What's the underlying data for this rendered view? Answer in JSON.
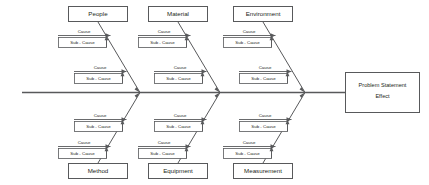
{
  "diagram": {
    "type": "fishbone-ishikawa-cause-and-effect",
    "colors": {
      "line": "#58595b",
      "text": "#231f20",
      "background": "#ffffff"
    },
    "effect": {
      "line1": "Problem Statement",
      "line2": "Effect"
    },
    "cause_label": "Cause",
    "subcause_label": "Sub - Cause",
    "categories": {
      "top": [
        {
          "id": "people",
          "label": "People",
          "causes": [
            {
              "label": "Cause",
              "subcause": "Sub - Cause"
            },
            {
              "label": "Cause",
              "subcause": "Sub - Cause"
            }
          ]
        },
        {
          "id": "material",
          "label": "Material",
          "causes": [
            {
              "label": "Cause",
              "subcause": "Sub - Cause"
            },
            {
              "label": "Cause",
              "subcause": "Sub - Cause"
            }
          ]
        },
        {
          "id": "environment",
          "label": "Environment",
          "causes": [
            {
              "label": "Cause",
              "subcause": "Sub - Cause"
            },
            {
              "label": "Cause",
              "subcause": "Sub - Cause"
            }
          ]
        }
      ],
      "bottom": [
        {
          "id": "method",
          "label": "Method",
          "causes": [
            {
              "label": "Cause",
              "subcause": "Sub - Cause"
            },
            {
              "label": "Cause",
              "subcause": "Sub - Cause"
            }
          ]
        },
        {
          "id": "equipment",
          "label": "Equipment",
          "causes": [
            {
              "label": "Cause",
              "subcause": "Sub - Cause"
            },
            {
              "label": "Cause",
              "subcause": "Sub - Cause"
            }
          ]
        },
        {
          "id": "measurement",
          "label": "Measurement",
          "causes": [
            {
              "label": "Cause",
              "subcause": "Sub - Cause"
            },
            {
              "label": "Cause",
              "subcause": "Sub - Cause"
            }
          ]
        }
      ]
    }
  }
}
